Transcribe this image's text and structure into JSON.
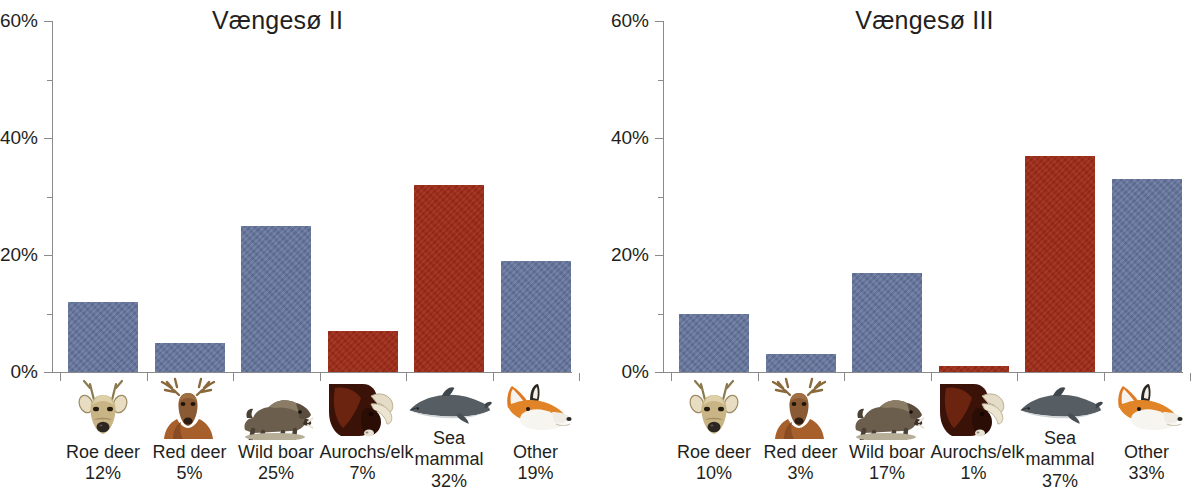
{
  "chart_data": [
    {
      "type": "bar",
      "title": "Vængesø II",
      "xlabel": "",
      "ylabel": "",
      "ylim": [
        0,
        60
      ],
      "yticks": [
        "0%",
        "20%",
        "40%",
        "60%"
      ],
      "ytick_values": [
        0,
        20,
        40,
        60
      ],
      "yminor_values": [
        10,
        30,
        50
      ],
      "grid": false,
      "legend": "none",
      "categories": [
        "Roe deer",
        "Red deer",
        "Wild boar",
        "Aurochs/elk",
        "Sea mammal",
        "Other"
      ],
      "values": [
        12,
        5,
        25,
        7,
        32,
        19
      ],
      "value_labels": [
        "12%",
        "5%",
        "25%",
        "7%",
        "32%",
        "19%"
      ],
      "bar_colors": [
        "#64749c",
        "#64749c",
        "#64749c",
        "#9e2a17",
        "#9e2a17",
        "#64749c"
      ],
      "icons": [
        "roe-deer-icon",
        "red-deer-icon",
        "wild-boar-icon",
        "aurochs-icon",
        "sea-mammal-icon",
        "fox-icon"
      ]
    },
    {
      "type": "bar",
      "title": "Vængesø III",
      "xlabel": "",
      "ylabel": "",
      "ylim": [
        0,
        60
      ],
      "yticks": [
        "0%",
        "20%",
        "40%",
        "60%"
      ],
      "ytick_values": [
        0,
        20,
        40,
        60
      ],
      "yminor_values": [
        10,
        30,
        50
      ],
      "grid": false,
      "legend": "none",
      "categories": [
        "Roe deer",
        "Red deer",
        "Wild boar",
        "Aurochs/elk",
        "Sea mammal",
        "Other"
      ],
      "values": [
        10,
        3,
        17,
        1,
        37,
        33
      ],
      "value_labels": [
        "10%",
        "3%",
        "17%",
        "1%",
        "37%",
        "33%"
      ],
      "bar_colors": [
        "#64749c",
        "#64749c",
        "#64749c",
        "#9e2a17",
        "#9e2a17",
        "#64749c"
      ],
      "icons": [
        "roe-deer-icon",
        "red-deer-icon",
        "wild-boar-icon",
        "aurochs-icon",
        "sea-mammal-icon",
        "fox-icon"
      ]
    }
  ],
  "colors": {
    "bar_blue": "#64749c",
    "bar_red": "#9e2a17",
    "axis": "#8a8a8a",
    "text": "#231f20",
    "background": "#ffffff"
  }
}
